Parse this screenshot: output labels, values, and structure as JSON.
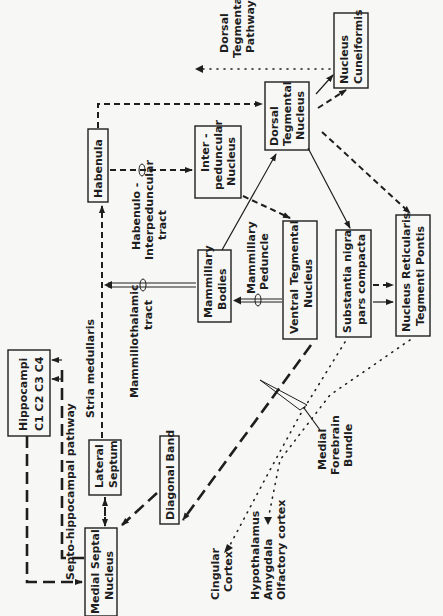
{
  "diagram": {
    "orientation": "rotated-90-ccw",
    "nodes": {
      "hippocampi": {
        "line1": "Hippocampi",
        "line2": "C1 C2 C3 C4"
      },
      "medial_septal": {
        "line1": "Medial  Septal",
        "line2": "Nucleus"
      },
      "lateral_septum": {
        "line1": "Lateral",
        "line2": "Septum"
      },
      "diagonal_band": {
        "line1": "Diagonal  Band"
      },
      "habenula": {
        "line1": "Habenula"
      },
      "mammillary_bodies": {
        "line1": "Mammillary",
        "line2": "Bodies"
      },
      "interpeduncular": {
        "line1": "Inter -",
        "line2": "peduncular",
        "line3": "Nucleus"
      },
      "ventral_tegmental": {
        "line1": "Ventral  Tegmental",
        "line2": "Nucleus"
      },
      "dorsal_tegmental": {
        "line1": "Dorsal",
        "line2": "Tegmental",
        "line3": "Nucleus"
      },
      "substantia_nigra": {
        "line1": "Substantia  nigra",
        "line2": "pars  compacta"
      },
      "nucleus_cuneiformis": {
        "line1": "Nucleus",
        "line2": "Cuneiformis"
      },
      "nucleus_reticularis": {
        "line1": "Nucleus  Reticularis",
        "line2": "Tegmenti  Pontis"
      }
    },
    "labels": {
      "septo_hippocampal": "Septo-hippocampal  pathway",
      "stria_medullaris": "Stria  medullaris",
      "mammillothalamic_1": "Mammillothalamic",
      "mammillothalamic_2": "tract",
      "habenulo_1": "Habenulo -",
      "habenulo_2": "Interpeduncular",
      "habenulo_3": "tract",
      "mammillary_peduncle_1": "Mammillary",
      "mammillary_peduncle_2": "Peduncle",
      "dorsal_tegmental_pathway_1": "Dorsal",
      "dorsal_tegmental_pathway_2": "Tegmental",
      "dorsal_tegmental_pathway_3": "Pathway",
      "mfb_1": "Medial",
      "mfb_2": "Forebrain",
      "mfb_3": "Bundle",
      "cingular_1": "Cingular",
      "cingular_2": "Cortex",
      "hypothalamus": "Hypothalamus",
      "amygdala": "Amygdala",
      "olfactory": "Olfactory  cortex"
    },
    "legend_line_styles": [
      "solid",
      "dashed",
      "long-dashed",
      "dotted",
      "double"
    ]
  }
}
